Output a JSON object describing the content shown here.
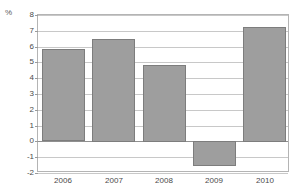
{
  "chart_data": {
    "type": "bar",
    "title": "",
    "subtitle": "",
    "xlabel": "",
    "ylabel": "%",
    "unit_label": "%",
    "categories": [
      "2006",
      "2007",
      "2008",
      "2009",
      "2010"
    ],
    "values": [
      5.85,
      6.5,
      4.85,
      -1.6,
      7.25
    ],
    "series": [
      {
        "name": "",
        "values": [
          5.85,
          6.5,
          4.85,
          -1.6,
          7.25
        ]
      }
    ],
    "ylim": [
      -2,
      8
    ],
    "yticks": [
      8,
      7,
      6,
      5,
      4,
      3,
      2,
      1,
      0,
      -1,
      -2
    ],
    "ytick_labels": [
      "8",
      "7",
      "6",
      "5",
      "4",
      "3",
      "2",
      "1",
      "0",
      "-1",
      "-2"
    ],
    "grid": true,
    "grid_axis": "y",
    "legend": false,
    "legend_position": "none",
    "bar_color": "#9e9e9e",
    "bar_border_color": "#7d7d7d",
    "gridline_color": "#c8c8c8",
    "zero_line_color": "#909090",
    "axis_border_color": "#b4b4b4",
    "tick_text_color": "#4a4a4a",
    "background_color": "#ffffff"
  }
}
